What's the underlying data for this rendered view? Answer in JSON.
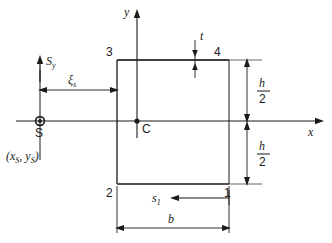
{
  "figure": {
    "type": "engineering-cross-section-diagram",
    "colors": {
      "line": "#1a1a1a",
      "background": "#ffffff"
    }
  },
  "axes": {
    "x_label": "x",
    "y_label": "y"
  },
  "points": {
    "shear_center_label": "S",
    "shear_center_coords": "(x",
    "shear_center_coords_sub1": "S",
    "shear_center_coords_mid": ", y",
    "shear_center_coords_sub2": "S",
    "shear_center_coords_end": ")",
    "centroid_label": "C"
  },
  "nodes": {
    "n1": "1",
    "n2": "2",
    "n3": "3",
    "n4": "4"
  },
  "forces": {
    "shear_force_symbol": "S",
    "shear_force_subscript": "y"
  },
  "dimensions": {
    "xi_symbol": "ξ",
    "xi_subscript": "s",
    "thickness": "t",
    "width": "b",
    "height_numerator": "h",
    "height_denominator": "2",
    "arc_length_symbol": "s",
    "arc_length_subscript": "1"
  }
}
